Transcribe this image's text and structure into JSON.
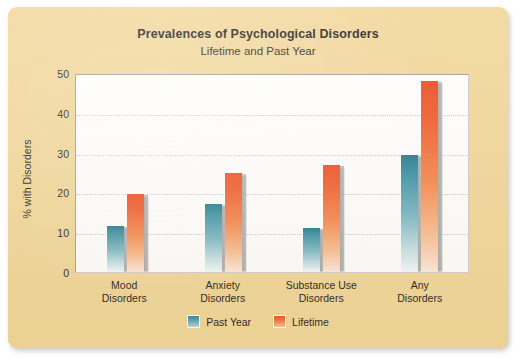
{
  "chart_data": {
    "type": "bar",
    "title": "Prevalences of Psychological Disorders",
    "subtitle": "Lifetime and Past Year",
    "xlabel": "",
    "ylabel": "% with Disorders",
    "ylim": [
      0,
      50
    ],
    "yticks": [
      0,
      10,
      20,
      30,
      40,
      50
    ],
    "grid": true,
    "legend_position": "bottom",
    "categories": [
      "Mood Disorders",
      "Anxiety Disorders",
      "Substance Use Disorders",
      "Any Disorders"
    ],
    "category_lines": [
      [
        "Mood",
        "Disorders"
      ],
      [
        "Anxiety",
        "Disorders"
      ],
      [
        "Substance Use",
        "Disorders"
      ],
      [
        "Any",
        "Disorders"
      ]
    ],
    "series": [
      {
        "name": "Past Year",
        "color": "#3e94a8",
        "values": [
          11.5,
          17.2,
          11.0,
          29.5
        ]
      },
      {
        "name": "Lifetime",
        "color": "#ef4a22",
        "values": [
          19.5,
          25.0,
          27.0,
          48.0
        ]
      }
    ]
  },
  "figure": {
    "background_color": "#f2d79a",
    "plot_background_color": "#ffffff"
  }
}
